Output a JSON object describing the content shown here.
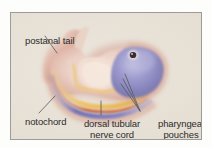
{
  "figure": {
    "background_color": "#e6e0d6",
    "frame_color": "#9b9b99",
    "page_color": "#fdfdfc",
    "label_text_color": "#2c2c2c",
    "leader_line_color": "#5a5a58"
  },
  "labels": [
    {
      "id": "postanal-tail",
      "text": "postanal tail"
    },
    {
      "id": "notochord",
      "text": "notochord"
    },
    {
      "id": "dorsal-tubular-nerve-cord",
      "text": "dorsal tubular nerve cord"
    },
    {
      "id": "pharyngeal-pouches",
      "text": "pharyngeal pouches"
    }
  ],
  "anatomy": {
    "head_brain_color": "#8d8cc4",
    "head_brain_highlight": "#b3b2d9",
    "eye_color": "#3a2630",
    "eye_ring_color": "#d8d2d8",
    "body_flesh_color": "#e3c6bd",
    "body_flesh_highlight": "#f0ded4",
    "notochord_color": "#7a79b8",
    "nerve_cord_color": "#e8bf6a",
    "gut_color": "#c9643f",
    "pharyngeal_pouch_color": "#e9b955",
    "tail_tint_color": "#d9a392"
  },
  "icons": {
    "leader_line": "leader-line"
  }
}
